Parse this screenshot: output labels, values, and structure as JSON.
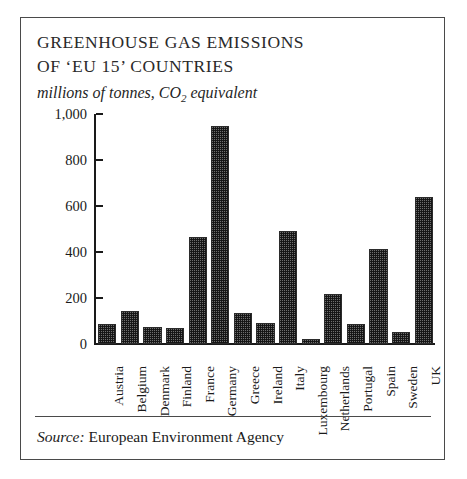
{
  "figure": {
    "title_line_1": "GREENHOUSE GAS EMISSIONS",
    "title_line_2": "OF ‘EU 15’ COUNTRIES",
    "subtitle_prefix": "millions of tonnes, CO",
    "subtitle_sub": "2",
    "subtitle_suffix": " equivalent",
    "source_label": "Source:",
    "source_text": " European Environment Agency",
    "border_color": "#4a4a4a",
    "bar_fill_color": "#6e6e6e",
    "bar_edge_color": "#2b2b2b",
    "axis_color": "#1a1a1a",
    "background_color": "#ffffff"
  },
  "chart_data": {
    "type": "bar",
    "title": "GREENHOUSE GAS EMISSIONS OF ‘EU 15’ COUNTRIES",
    "subtitle": "millions of tonnes, CO2 equivalent",
    "xlabel": "",
    "ylabel": "",
    "ylim": [
      0,
      1000
    ],
    "yticks": [
      0,
      200,
      400,
      600,
      800,
      1000
    ],
    "ytick_labels": [
      "0",
      "200",
      "400",
      "600",
      "800",
      "1,000"
    ],
    "grid": false,
    "legend": false,
    "source": "Source: European Environment Agency",
    "categories": [
      "Austria",
      "Belgium",
      "Denmark",
      "Finland",
      "France",
      "Germany",
      "Greece",
      "Ireland",
      "Italy",
      "Luxembourg",
      "Netherlands",
      "Portugal",
      "Spain",
      "Sweden",
      "UK"
    ],
    "values": [
      88,
      142,
      75,
      70,
      467,
      948,
      135,
      90,
      490,
      22,
      218,
      88,
      415,
      53,
      638
    ]
  }
}
